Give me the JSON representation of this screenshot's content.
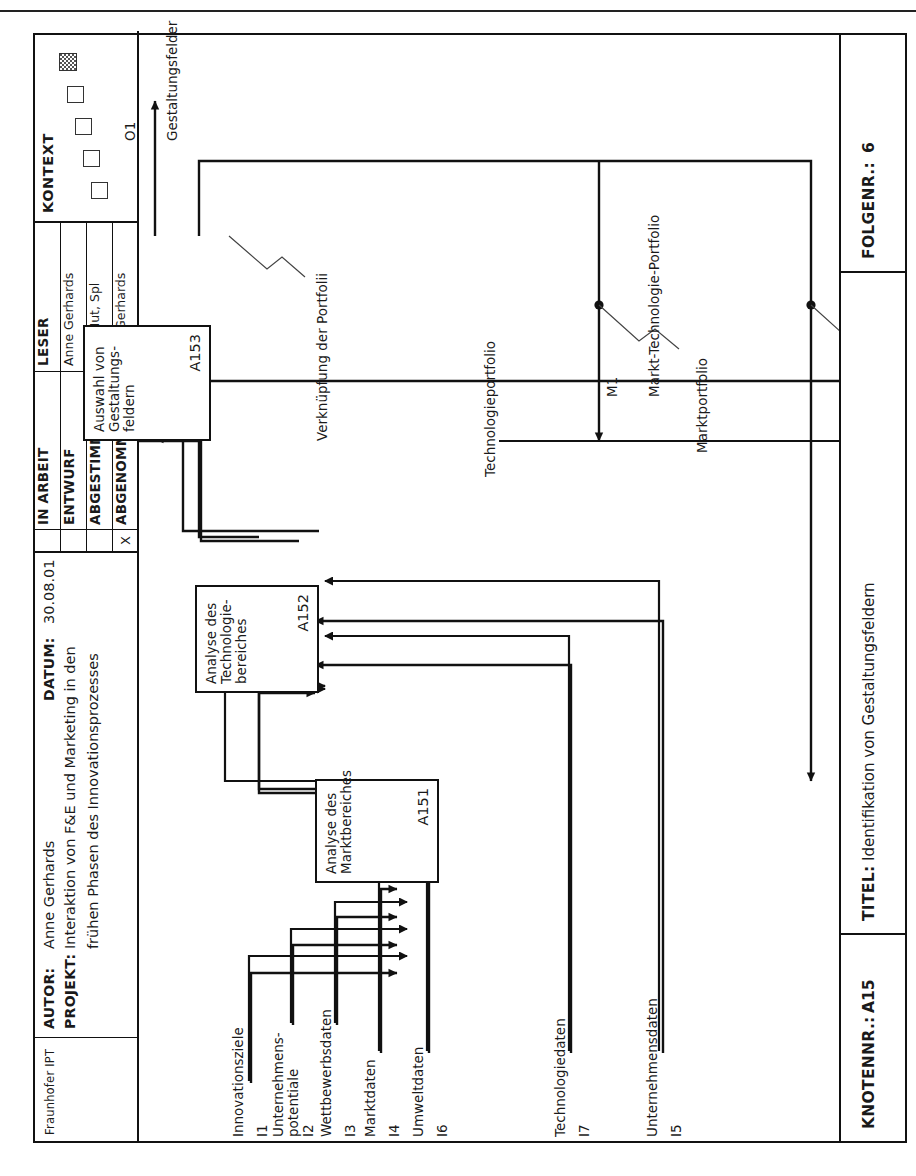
{
  "page": {
    "top_rule": true
  },
  "titleblock": {
    "logo": "Fraunhofer IPT",
    "autor_label": "AUTOR:",
    "autor_value": "Anne Gerhards",
    "projekt_label": "PROJEKT:",
    "projekt_line1": "Interaktion von F&E und Marketing in den",
    "projekt_line2": "frühen Phasen des Innovationsprozesses",
    "datum_label": "DATUM:",
    "datum_value": "30.08.01",
    "leser_label": "LESER",
    "status_rows": [
      {
        "x": "",
        "name": "IN ARBEIT",
        "reader": ""
      },
      {
        "x": "",
        "name": "ENTWURF",
        "reader": "Anne Gerhards"
      },
      {
        "x": "",
        "name": "ABGESTIMMT",
        "reader": "Bdb, Mut, Spl"
      },
      {
        "x": "X",
        "name": "ABGENOMMEN",
        "reader": "Anne Gerhards"
      }
    ],
    "kontext_label": "KONTEXT"
  },
  "diagram": {
    "type": "idef0",
    "boxes": [
      {
        "id": "A151",
        "title_line1": "Analyse des",
        "title_line2": "Marktbereiches",
        "code": "A151"
      },
      {
        "id": "A152",
        "title_line1": "Analyse des",
        "title_line2": "Technologie-",
        "title_line3": "bereiches",
        "code": "A152"
      },
      {
        "id": "A153",
        "title_line1": "Auswahl von",
        "title_line2": "Gestaltungs-",
        "title_line3": "feldern",
        "code": "A153"
      }
    ],
    "inputs": [
      {
        "code": "I1",
        "label": "Innovationsziele",
        "target": "A151"
      },
      {
        "code": "I2",
        "label_line1": "Unternehmens-",
        "label_line2": "potentiale",
        "target": "A151"
      },
      {
        "code": "I3",
        "label": "Wettbewerbsdaten",
        "target": "A151"
      },
      {
        "code": "I4",
        "label": "Marktdaten",
        "target": "A151"
      },
      {
        "code": "I6",
        "label": "Umweltdaten",
        "target": "A151"
      },
      {
        "code": "I7",
        "label": "Technologiedaten",
        "target": "A152"
      },
      {
        "code": "I5",
        "label": "Unternehmensdaten",
        "target": "A152"
      }
    ],
    "outputs": [
      {
        "code": "O1",
        "label": "Gestaltungsfelder",
        "source": "A153"
      }
    ],
    "mechanisms": [
      {
        "code": "M1",
        "label": "Markt-Technologie-Portfolio"
      }
    ],
    "flow_labels": [
      {
        "name": "Marktportfolio"
      },
      {
        "name": "Technologieportfolio"
      },
      {
        "name": "Verknüpfung der Portfolii"
      }
    ]
  },
  "footer": {
    "node_label": "KNOTENNR.:",
    "node_value": "A15",
    "title_label": "TITEL:",
    "title_value": "Identifikation von Gestaltungsfeldern",
    "seq_label": "FOLGENR.:",
    "seq_value": "6"
  }
}
